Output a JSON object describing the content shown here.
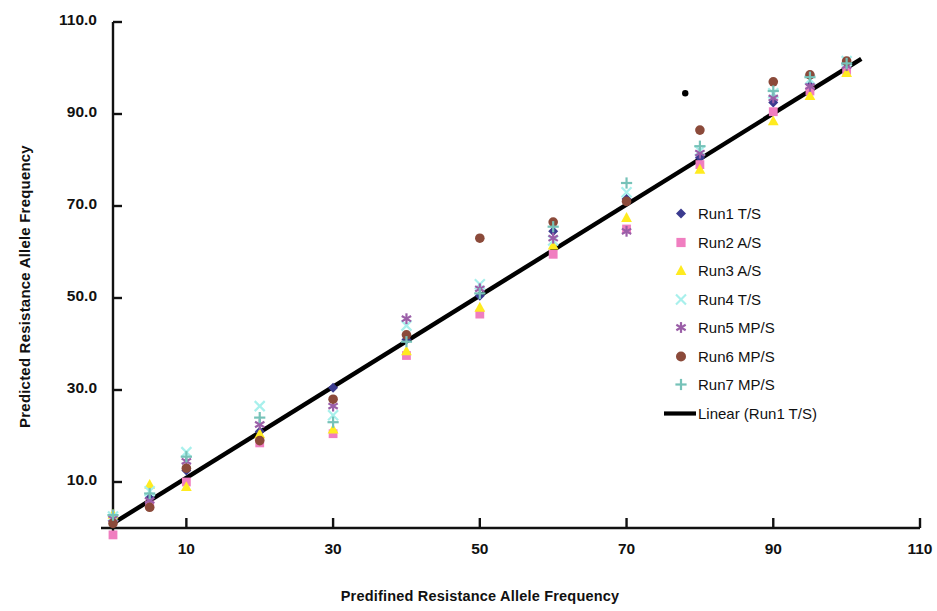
{
  "chart_data": {
    "type": "scatter",
    "title": "",
    "xlabel": "Predifined Resistance Allele Frequency",
    "ylabel": "Predicted Resistance Allele Frequency",
    "xlim": [
      0,
      110
    ],
    "ylim": [
      0,
      110
    ],
    "xticks": [
      10,
      30,
      50,
      70,
      90,
      110
    ],
    "xtick_labels": [
      "10",
      "30",
      "50",
      "70",
      "90",
      "110"
    ],
    "yticks": [
      10,
      30,
      50,
      70,
      90,
      110
    ],
    "ytick_labels": [
      "10.0",
      "30.0",
      "50.0",
      "70.0",
      "90.0",
      "110.0"
    ],
    "grid": false,
    "legend_position": "right",
    "series": [
      {
        "name": "Run1 T/S",
        "marker": "diamond",
        "color": "#3b3b8f",
        "points": [
          [
            0,
            1.5
          ],
          [
            5,
            6.5
          ],
          [
            10,
            12.5
          ],
          [
            20,
            21.0
          ],
          [
            30,
            30.5
          ],
          [
            40,
            41.0
          ],
          [
            50,
            50.5
          ],
          [
            60,
            64.5
          ],
          [
            70,
            71.5
          ],
          [
            80,
            80.5
          ],
          [
            90,
            92.5
          ],
          [
            95,
            96.5
          ],
          [
            100,
            101.0
          ]
        ]
      },
      {
        "name": "Run2 A/S",
        "marker": "square",
        "color": "#f07ec0",
        "points": [
          [
            0,
            -1.5
          ],
          [
            5,
            5.0
          ],
          [
            10,
            10.0
          ],
          [
            20,
            18.5
          ],
          [
            30,
            20.5
          ],
          [
            40,
            37.5
          ],
          [
            50,
            46.5
          ],
          [
            60,
            59.5
          ],
          [
            70,
            65.0
          ],
          [
            80,
            79.0
          ],
          [
            90,
            90.5
          ],
          [
            95,
            95.0
          ],
          [
            100,
            99.5
          ]
        ]
      },
      {
        "name": "Run3 A/S",
        "marker": "triangle",
        "color": "#ffeb1f",
        "points": [
          [
            0,
            3.0
          ],
          [
            5,
            9.5
          ],
          [
            10,
            9.0
          ],
          [
            20,
            20.5
          ],
          [
            30,
            21.5
          ],
          [
            40,
            38.5
          ],
          [
            50,
            48.0
          ],
          [
            60,
            61.5
          ],
          [
            70,
            67.5
          ],
          [
            80,
            78.0
          ],
          [
            90,
            88.5
          ],
          [
            95,
            94.0
          ],
          [
            100,
            99.0
          ]
        ]
      },
      {
        "name": "Run4 T/S",
        "marker": "cross",
        "color": "#a8f0ec",
        "points": [
          [
            0,
            2.5
          ],
          [
            5,
            8.0
          ],
          [
            10,
            16.5
          ],
          [
            20,
            26.5
          ],
          [
            30,
            24.5
          ],
          [
            40,
            44.0
          ],
          [
            50,
            53.0
          ],
          [
            60,
            62.5
          ],
          [
            70,
            73.0
          ],
          [
            80,
            82.0
          ],
          [
            90,
            94.5
          ],
          [
            95,
            97.5
          ],
          [
            100,
            101.5
          ]
        ]
      },
      {
        "name": "Run5 MP/S",
        "marker": "star",
        "color": "#9b5fa8",
        "points": [
          [
            0,
            2.0
          ],
          [
            5,
            6.0
          ],
          [
            10,
            14.5
          ],
          [
            20,
            22.5
          ],
          [
            30,
            26.5
          ],
          [
            40,
            45.5
          ],
          [
            50,
            52.0
          ],
          [
            60,
            63.0
          ],
          [
            70,
            64.5
          ],
          [
            80,
            81.5
          ],
          [
            90,
            93.5
          ],
          [
            95,
            96.0
          ],
          [
            100,
            100.5
          ]
        ]
      },
      {
        "name": "Run6 MP/S",
        "marker": "circle",
        "color": "#8b4a3a",
        "points": [
          [
            0,
            1.0
          ],
          [
            5,
            4.5
          ],
          [
            10,
            13.0
          ],
          [
            20,
            19.0
          ],
          [
            30,
            28.0
          ],
          [
            40,
            42.0
          ],
          [
            50,
            63.0
          ],
          [
            60,
            66.5
          ],
          [
            70,
            71.0
          ],
          [
            80,
            86.5
          ],
          [
            90,
            97.0
          ],
          [
            95,
            98.5
          ],
          [
            100,
            101.5
          ]
        ]
      },
      {
        "name": "Run7 MP/S",
        "marker": "plus",
        "color": "#76c2b8",
        "points": [
          [
            0,
            2.8
          ],
          [
            5,
            7.5
          ],
          [
            10,
            15.5
          ],
          [
            20,
            24.0
          ],
          [
            30,
            23.0
          ],
          [
            40,
            40.5
          ],
          [
            50,
            51.0
          ],
          [
            60,
            65.5
          ],
          [
            70,
            75.0
          ],
          [
            80,
            83.0
          ],
          [
            90,
            95.0
          ],
          [
            95,
            98.0
          ],
          [
            100,
            101.0
          ]
        ]
      },
      {
        "name": "Outlier",
        "marker": "dot",
        "color": "#000000",
        "points": [
          [
            78,
            94.5
          ]
        ]
      }
    ],
    "trendline": {
      "name": "Linear (Run1 T/S)",
      "color": "#000000",
      "x1": 0,
      "y1": 1.0,
      "x2": 102,
      "y2": 102.0
    }
  },
  "legend": {
    "items": [
      {
        "label": "Run1 T/S",
        "marker": "diamond",
        "color": "#3b3b8f"
      },
      {
        "label": "Run2 A/S",
        "marker": "square",
        "color": "#f07ec0"
      },
      {
        "label": "Run3 A/S",
        "marker": "triangle",
        "color": "#ffeb1f"
      },
      {
        "label": "Run4 T/S",
        "marker": "cross",
        "color": "#a8f0ec"
      },
      {
        "label": "Run5 MP/S",
        "marker": "star",
        "color": "#9b5fa8"
      },
      {
        "label": "Run6 MP/S",
        "marker": "circle",
        "color": "#8b4a3a"
      },
      {
        "label": "Run7 MP/S",
        "marker": "plus",
        "color": "#76c2b8"
      },
      {
        "label": "Linear (Run1 T/S)",
        "marker": "line",
        "color": "#000000"
      }
    ]
  },
  "axes": {
    "color": "#111111"
  }
}
